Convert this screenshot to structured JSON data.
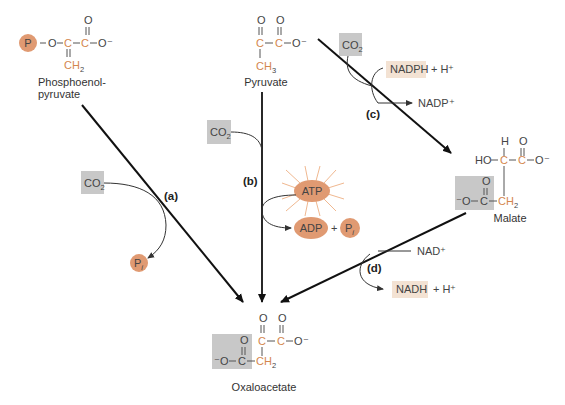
{
  "colors": {
    "orange_carbon": "#d4864e",
    "phosphate_circle": "#e09a72",
    "co2_box": "#c8c8c8",
    "nad_box": "#f3e2d3",
    "arrow": "#111111",
    "text": "#444444"
  },
  "molecules": {
    "pep": {
      "name_line1": "Phosphoenol-",
      "name_line2": "pyruvate",
      "p_label": "P",
      "o": "O",
      "c": "C",
      "o_minus": "O⁻",
      "ch2": "CH",
      "ch2_sub": "2"
    },
    "pyruvate": {
      "name": "Pyruvate",
      "ch3": "CH",
      "ch3_sub": "3"
    },
    "malate": {
      "name": "Malate",
      "h": "H",
      "ho": "HO",
      "ch2": "CH",
      "ch2_sub": "2"
    },
    "oxaloacetate": {
      "name": "Oxaloacetate",
      "ch2": "CH",
      "ch2_sub": "2"
    }
  },
  "reactions": {
    "a": {
      "label": "(a)",
      "input": "CO",
      "input_sub": "2",
      "output": "P",
      "output_sub": "i"
    },
    "b": {
      "label": "(b)",
      "input": "CO",
      "input_sub": "2",
      "cofactor": "ATP",
      "product1": "ADP",
      "plus": "+",
      "product2": "P",
      "product2_sub": "i"
    },
    "c": {
      "label": "(c)",
      "input": "CO",
      "input_sub": "2",
      "cofactor": "NADPH",
      "cofactor_extra": "+ H⁺",
      "product": "NADP⁺"
    },
    "d": {
      "label": "(d)",
      "input": "NAD⁺",
      "product": "NADH",
      "product_extra": "+ H⁺"
    }
  }
}
